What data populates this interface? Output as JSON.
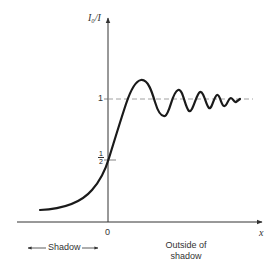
{
  "diagram": {
    "type": "diffraction-intensity-near-shadow-edge",
    "y_axis_label": "I₀/I",
    "x_axis_label": "x",
    "y_ticks": [
      {
        "label": "1",
        "value": 1
      },
      {
        "label_num": "1",
        "label_den": "2",
        "value": 0.5
      }
    ],
    "x_ticks": [
      {
        "label": "0",
        "value": 0
      }
    ],
    "regions": {
      "left": "Shadow",
      "right_line1": "Outside of",
      "right_line2": "shadow"
    },
    "colors": {
      "curve": "#1a1a1a",
      "axis": "#333333",
      "dashed": "#888888"
    }
  }
}
